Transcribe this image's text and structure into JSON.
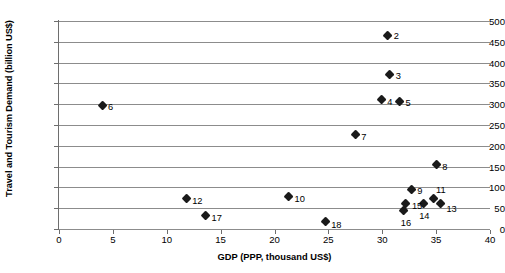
{
  "chart_data": {
    "type": "scatter",
    "title": "",
    "xlabel": "GDP (PPP, thousand US$)",
    "ylabel": "Travel and Tourism Demand (billion US$)",
    "xlim": [
      0,
      40
    ],
    "ylim": [
      0,
      500
    ],
    "xticks": [
      0,
      5,
      10,
      15,
      20,
      25,
      30,
      35,
      40
    ],
    "yticks": [
      0,
      50,
      100,
      150,
      200,
      250,
      300,
      350,
      400,
      450,
      500
    ],
    "xtick_labels": [
      "0",
      "5",
      "10",
      "15",
      "20",
      "25",
      "30",
      "35",
      "40"
    ],
    "ytick_labels": [
      "0",
      "50",
      "100",
      "150",
      "200",
      "250",
      "300",
      "350",
      "400",
      "450",
      "500"
    ],
    "grid": "horizontal",
    "legend": "none",
    "marker": "diamond",
    "marker_color": "#1a1a1a",
    "points": [
      {
        "label": "2",
        "x": 30.5,
        "y": 466,
        "lx": 6,
        "ly": -4
      },
      {
        "label": "3",
        "x": 30.7,
        "y": 372,
        "lx": 6,
        "ly": -3
      },
      {
        "label": "4",
        "x": 29.9,
        "y": 311,
        "lx": 6,
        "ly": -3
      },
      {
        "label": "5",
        "x": 31.6,
        "y": 307,
        "lx": 6,
        "ly": -3
      },
      {
        "label": "6",
        "x": 4.0,
        "y": 297,
        "lx": 6,
        "ly": -3
      },
      {
        "label": "7",
        "x": 27.5,
        "y": 226,
        "lx": 6,
        "ly": -3
      },
      {
        "label": "8",
        "x": 35.0,
        "y": 154,
        "lx": 6,
        "ly": -3
      },
      {
        "label": "9",
        "x": 32.7,
        "y": 95,
        "lx": 6,
        "ly": -3
      },
      {
        "label": "10",
        "x": 21.3,
        "y": 78,
        "lx": 6,
        "ly": -3
      },
      {
        "label": "11",
        "x": 34.8,
        "y": 72,
        "lx": 2,
        "ly": -14
      },
      {
        "label": "12",
        "x": 11.8,
        "y": 73,
        "lx": 6,
        "ly": -3
      },
      {
        "label": "13",
        "x": 35.4,
        "y": 60,
        "lx": 6,
        "ly": 0
      },
      {
        "label": "14",
        "x": 33.8,
        "y": 60,
        "lx": -4,
        "ly": 7
      },
      {
        "label": "15",
        "x": 32.2,
        "y": 62,
        "lx": 6,
        "ly": -2
      },
      {
        "label": "16",
        "x": 32.0,
        "y": 45,
        "lx": -3,
        "ly": 8
      },
      {
        "label": "17",
        "x": 13.6,
        "y": 33,
        "lx": 6,
        "ly": -2
      },
      {
        "label": "18",
        "x": 24.7,
        "y": 18,
        "lx": 6,
        "ly": -2
      }
    ]
  }
}
